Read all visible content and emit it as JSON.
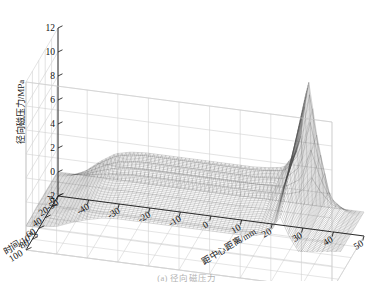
{
  "figure": {
    "caption": "(a) 径向磁压力",
    "background": "#ffffff",
    "mesh_color": "#4a4a4a",
    "grid_color": "#d0d0d0",
    "axis_color": "#1a1a1a"
  },
  "chart_data": {
    "type": "surface",
    "title": "",
    "projection": "3d-mesh",
    "grid": true,
    "legend": "none",
    "zlabel": "径向磁压力/MPa",
    "zticks": [
      -2,
      0,
      2,
      4,
      6,
      8,
      10,
      12
    ],
    "zlim": [
      -2,
      12
    ],
    "xlabel": "距中心距离/mm",
    "xticks": [
      -50,
      -40,
      -30,
      -20,
      -10,
      0,
      10,
      20,
      30,
      40,
      50
    ],
    "xlim": [
      -50,
      50
    ],
    "ylabel": "时间/10",
    "ylabel_exponent": "-6",
    "ylabel_unit": "s",
    "yticks": [
      0,
      20,
      40,
      60,
      80,
      100
    ],
    "ylim": [
      0,
      100
    ],
    "peak_value": 11.0,
    "peak_x": 33,
    "peak_y": 10,
    "plateau_value": 3.0,
    "x": [
      -50,
      -45,
      -40,
      -35,
      -30,
      -25,
      -20,
      -15,
      -10,
      -5,
      0,
      5,
      10,
      15,
      20,
      25,
      30,
      33,
      36,
      40,
      45,
      50
    ],
    "y": [
      0,
      10,
      20,
      30,
      40,
      50,
      60,
      70,
      80,
      90,
      100
    ],
    "series": [
      {
        "name": "t=0",
        "values": [
          0,
          0,
          0,
          0,
          0,
          0,
          0,
          0,
          0,
          0,
          0,
          0,
          0,
          0,
          0,
          0,
          0,
          0,
          0,
          0,
          0,
          0
        ]
      },
      {
        "name": "t=10",
        "values": [
          0.1,
          0.3,
          0.9,
          1.9,
          2.7,
          3.0,
          3.1,
          3.1,
          3.1,
          3.1,
          3.1,
          3.1,
          3.1,
          3.1,
          3.2,
          3.4,
          5.2,
          11.0,
          6.0,
          1.4,
          0.3,
          0.0
        ]
      },
      {
        "name": "t=20",
        "values": [
          0.1,
          0.3,
          0.8,
          1.8,
          2.6,
          2.9,
          3.0,
          3.0,
          3.0,
          3.0,
          3.0,
          3.0,
          3.0,
          3.0,
          3.1,
          3.3,
          5.0,
          10.4,
          5.7,
          1.3,
          0.3,
          0.0
        ]
      },
      {
        "name": "t=30",
        "values": [
          0.1,
          0.3,
          0.8,
          1.7,
          2.5,
          2.8,
          2.9,
          2.9,
          2.9,
          2.9,
          2.9,
          2.9,
          2.9,
          2.9,
          3.0,
          3.2,
          4.7,
          9.6,
          5.3,
          1.2,
          0.3,
          0.0
        ]
      },
      {
        "name": "t=40",
        "values": [
          0.1,
          0.3,
          0.7,
          1.6,
          2.3,
          2.6,
          2.7,
          2.7,
          2.7,
          2.7,
          2.7,
          2.7,
          2.7,
          2.8,
          2.8,
          3.0,
          4.4,
          8.8,
          4.9,
          1.1,
          0.2,
          0.0
        ]
      },
      {
        "name": "t=50",
        "values": [
          0.1,
          0.2,
          0.7,
          1.5,
          2.2,
          2.5,
          2.6,
          2.6,
          2.6,
          2.6,
          2.6,
          2.6,
          2.6,
          2.6,
          2.7,
          2.9,
          4.1,
          8.0,
          4.4,
          1.0,
          0.2,
          0.0
        ]
      },
      {
        "name": "t=60",
        "values": [
          0.1,
          0.2,
          0.6,
          1.3,
          2.0,
          2.3,
          2.4,
          2.4,
          2.4,
          2.4,
          2.4,
          2.4,
          2.4,
          2.4,
          2.5,
          2.7,
          3.8,
          7.2,
          4.0,
          0.9,
          0.2,
          0.0
        ]
      },
      {
        "name": "t=70",
        "values": [
          0.1,
          0.2,
          0.5,
          1.2,
          1.8,
          2.1,
          2.2,
          2.2,
          2.2,
          2.2,
          2.2,
          2.2,
          2.2,
          2.2,
          2.3,
          2.4,
          3.4,
          6.3,
          3.5,
          0.8,
          0.2,
          0.0
        ]
      },
      {
        "name": "t=80",
        "values": [
          0.0,
          0.2,
          0.5,
          1.1,
          1.6,
          1.9,
          2.0,
          2.0,
          2.0,
          2.0,
          2.0,
          2.0,
          2.0,
          2.0,
          2.1,
          2.2,
          3.0,
          5.4,
          3.0,
          0.7,
          0.1,
          0.0
        ]
      },
      {
        "name": "t=90",
        "values": [
          0.0,
          0.1,
          0.4,
          0.9,
          1.4,
          1.7,
          1.8,
          1.8,
          1.8,
          1.8,
          1.8,
          1.8,
          1.8,
          1.8,
          1.8,
          2.0,
          2.6,
          4.5,
          2.5,
          0.6,
          0.1,
          0.0
        ]
      },
      {
        "name": "t=100",
        "values": [
          0.0,
          0.1,
          0.3,
          0.8,
          1.2,
          1.5,
          1.6,
          1.6,
          1.6,
          1.6,
          1.6,
          1.6,
          1.6,
          1.6,
          1.6,
          1.7,
          2.2,
          3.6,
          2.0,
          0.5,
          0.1,
          0.0
        ]
      }
    ]
  }
}
